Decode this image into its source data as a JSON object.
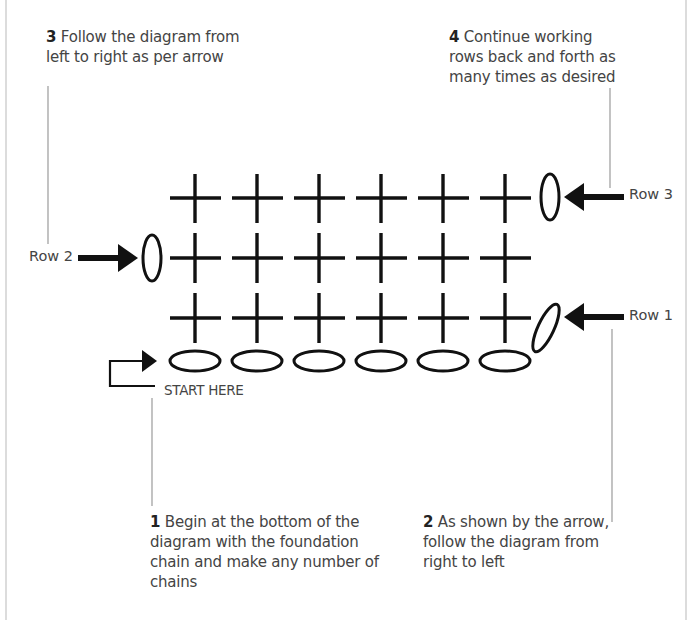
{
  "notes": [
    {
      "id": "step-1",
      "number": "1",
      "text": " Begin at the bottom of the diagram with the foundation chain and make any number of chains"
    },
    {
      "id": "step-2",
      "number": "2",
      "text": " As shown by the arrow, follow the diagram from right to left"
    },
    {
      "id": "step-3",
      "number": "3",
      "text": " Follow the diagram from left to right as per arrow"
    },
    {
      "id": "step-4",
      "number": "4",
      "text": " Continue working rows back and forth as many times as desired"
    }
  ],
  "row_labels": {
    "row1": "Row 1",
    "row2": "Row 2",
    "row3": "Row 3"
  },
  "start_label": "START HERE",
  "diagram": {
    "foundation_chains": 6,
    "stitches_per_row": 6,
    "rows": 3,
    "symbols": {
      "chain": "oval",
      "single_crochet": "cross",
      "turning_chain": "upright-oval"
    },
    "colors": {
      "ink": "#111111",
      "leader_line": "#9a9a9a",
      "frame": "#dcdcdc"
    }
  }
}
